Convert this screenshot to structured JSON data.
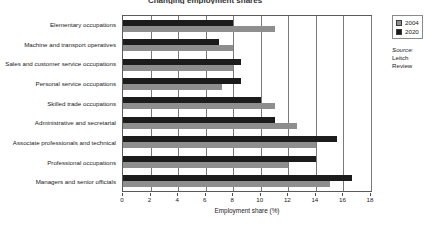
{
  "chart_data": {
    "type": "bar",
    "orientation": "horizontal",
    "title": "Changing employment shares",
    "xlabel": "Employment share (%)",
    "ylabel": "",
    "xlim": [
      0,
      18
    ],
    "xticks": [
      0,
      2,
      4,
      6,
      8,
      10,
      12,
      14,
      16,
      18
    ],
    "grid": true,
    "legend_position": "top-right",
    "categories": [
      "Elementary occupations",
      "Machine and transport operatives",
      "Sales and customer service occupations",
      "Personal service occupations",
      "Skilled trade occupations",
      "Administrative and secretarial",
      "Associate professionals and technical",
      "Professional occupations",
      "Managers and senior officials"
    ],
    "series": [
      {
        "name": "2004",
        "color": "#8e8e8e",
        "values": [
          11.0,
          8.0,
          8.0,
          7.2,
          11.0,
          12.6,
          14.0,
          12.0,
          15.0
        ]
      },
      {
        "name": "2020",
        "color": "#1c1c1c",
        "values": [
          8.0,
          7.0,
          8.6,
          8.6,
          10.0,
          11.0,
          15.5,
          14.0,
          16.6
        ]
      }
    ]
  },
  "legend": {
    "entries": [
      {
        "label": "2004"
      },
      {
        "label": "2020"
      }
    ]
  },
  "source": {
    "label": "Source:",
    "line1": "Leitch",
    "line2": "Review"
  }
}
